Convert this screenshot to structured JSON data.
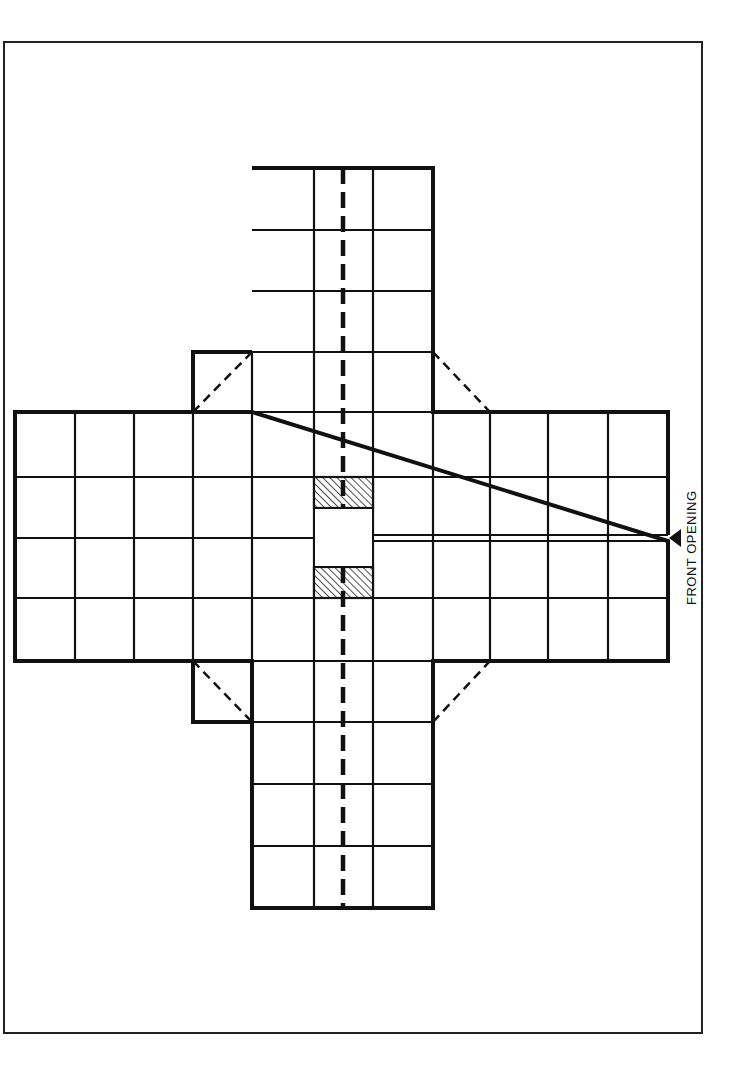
{
  "diagram": {
    "type": "cross-shaped game board plan",
    "frame": {
      "x": 4,
      "y": 42,
      "width": 698,
      "height": 991,
      "color": "#222222"
    },
    "colors": {
      "line": "#111111",
      "hatch": "#222222",
      "background": "#ffffff"
    },
    "label": {
      "text": "FRONT OPENING",
      "orientation": "vertical, reads bottom-to-top"
    },
    "arms": {
      "top": {
        "x": [
          252,
          314,
          373,
          433
        ],
        "y": [
          168,
          230,
          291,
          352,
          412
        ],
        "centerline": "dashed"
      },
      "bottom": {
        "x": [
          252,
          314,
          373,
          433
        ],
        "y": [
          661,
          722,
          784,
          846,
          908
        ],
        "centerline": "dashed"
      },
      "left": {
        "x": [
          15,
          75,
          134,
          193
        ],
        "y": [
          412,
          477,
          538,
          598,
          661
        ]
      },
      "right": {
        "x": [
          372,
          432,
          490,
          548,
          608,
          668
        ],
        "y": [
          412,
          477,
          538,
          598,
          661
        ],
        "slit": "open slot along middle row leading to front opening"
      }
    },
    "center": {
      "hatched_blocks": 2,
      "opening": "white square in middle"
    },
    "corner_flaps": [
      {
        "position": "upper-left",
        "style": "solid box with dashed diagonal"
      },
      {
        "position": "upper-right",
        "style": "dashed diagonal"
      },
      {
        "position": "lower-left",
        "style": "solid box with dashed diagonal"
      },
      {
        "position": "lower-right",
        "style": "dashed diagonal"
      }
    ]
  }
}
